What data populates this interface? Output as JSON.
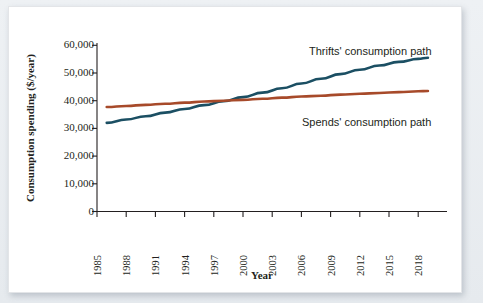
{
  "figure": {
    "background_color": "#ffffff",
    "page_color": "#e8ecef"
  },
  "chart_data": {
    "type": "line",
    "title": "",
    "subtitle": "",
    "xlabel": "Year",
    "ylabel": "Consumption spending ($/year)",
    "xlim": [
      1985,
      2020
    ],
    "ylim": [
      0,
      60000
    ],
    "grid": false,
    "legend_position": "inline-annotation",
    "xticks": [
      "1985",
      "1988",
      "1991",
      "1994",
      "1997",
      "2000",
      "2003",
      "2006",
      "2009",
      "2012",
      "2015",
      "2018"
    ],
    "xtick_values": [
      1985,
      1988,
      1991,
      1994,
      1997,
      2000,
      2003,
      2006,
      2009,
      2012,
      2015,
      2018
    ],
    "yticks": [
      "0",
      "10,000",
      "20,000",
      "30,000",
      "40,000",
      "50,000",
      "60,000"
    ],
    "ytick_values": [
      0,
      10000,
      20000,
      30000,
      40000,
      50000,
      60000
    ],
    "x": [
      1986,
      1988,
      1990,
      1992,
      1994,
      1996,
      1998,
      2000,
      2002,
      2004,
      2006,
      2008,
      2010,
      2012,
      2014,
      2016,
      2018,
      2019
    ],
    "series": [
      {
        "name": "Thrifts' consumption path",
        "color": "#1b4f63",
        "values": [
          32000,
          33200,
          34400,
          35700,
          37000,
          38400,
          39800,
          41300,
          42900,
          44500,
          46200,
          47900,
          49600,
          51200,
          52700,
          54000,
          55100,
          55500
        ]
      },
      {
        "name": "Spends' consumption path",
        "color": "#a74a2a",
        "values": [
          37700,
          38100,
          38500,
          38900,
          39300,
          39700,
          40000,
          40300,
          40700,
          41100,
          41500,
          41800,
          42200,
          42500,
          42800,
          43100,
          43400,
          43500
        ]
      }
    ],
    "annotations": [
      {
        "text": "Thrifts' consumption path",
        "x_px": 300,
        "y_px": 48
      },
      {
        "text": "Spends' consumption path",
        "x_px": 293,
        "y_px": 119
      }
    ],
    "crossing_point": {
      "year": 2001,
      "value": 40000
    }
  }
}
